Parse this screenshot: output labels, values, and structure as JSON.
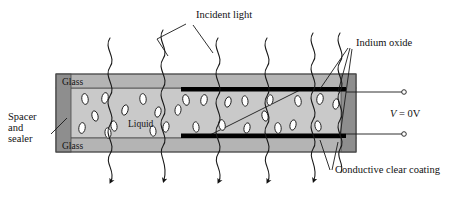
{
  "figure": {
    "type": "liquid-crystal-cell-cross-section",
    "canvas": {
      "width": 473,
      "height": 197
    },
    "background": "#ffffff"
  },
  "colors": {
    "glass_fill": "#b4b4b4",
    "liquid_fill": "#c9c9c9",
    "spacer_fill": "#8e8e8e",
    "electrode_fill": "#000000",
    "outline": "#4a4a4a",
    "ink": "#111111",
    "lc_particle_fill": "#ffffff"
  },
  "labels": {
    "incident_light": "Incident light",
    "indium_oxide": "Indium oxide",
    "conductive_clear_coating": "Conductive clear coating",
    "spacer_line1": "Spacer",
    "spacer_line2": "and",
    "spacer_line3": "sealer",
    "glass_top": "Glass",
    "glass_bottom": "Glass",
    "liquid": "Liquid",
    "voltage_symbol": "V",
    "voltage_value": " = 0V"
  },
  "geometry": {
    "cell": {
      "x": 56,
      "y": 74,
      "width": 300,
      "height": 78
    },
    "glass_top_band": {
      "x": 56,
      "y": 74,
      "width": 300,
      "height": 14
    },
    "glass_bottom_band": {
      "x": 56,
      "y": 138,
      "width": 300,
      "height": 14
    },
    "liquid_region": {
      "x": 56,
      "y": 88,
      "width": 300,
      "height": 50
    },
    "spacer_left": {
      "x": 56,
      "y": 74,
      "width": 15,
      "height": 78
    },
    "spacer_right": {
      "x": 341,
      "y": 74,
      "width": 15,
      "height": 78
    },
    "electrode_top": {
      "x": 181,
      "y": 87,
      "width": 165,
      "height": 4
    },
    "electrode_bottom": {
      "x": 181,
      "y": 134,
      "width": 165,
      "height": 4
    }
  },
  "rays": [
    {
      "id": "ray-1",
      "x": 110,
      "top": 38,
      "bottom": 190,
      "arrow": true
    },
    {
      "id": "ray-2",
      "x": 163,
      "top": 30,
      "bottom": 190,
      "arrow": true
    },
    {
      "id": "ray-3",
      "x": 218,
      "top": 38,
      "bottom": 190,
      "arrow": true
    },
    {
      "id": "ray-4",
      "x": 267,
      "top": 38,
      "bottom": 190,
      "arrow": true
    },
    {
      "id": "ray-5",
      "x": 313,
      "top": 33,
      "bottom": 190,
      "arrow": true
    },
    {
      "id": "ray-6",
      "x": 340,
      "top": 33,
      "bottom": 178,
      "arrow": false
    }
  ],
  "lc_particles": [
    {
      "cx": 85,
      "cy": 99,
      "rx": 3.2,
      "ry": 5.4,
      "rot": -8
    },
    {
      "cx": 105,
      "cy": 98,
      "rx": 3.2,
      "ry": 5.4,
      "rot": 10
    },
    {
      "cx": 143,
      "cy": 99,
      "rx": 3.2,
      "ry": 5.4,
      "rot": -5
    },
    {
      "cx": 125,
      "cy": 110,
      "rx": 3.0,
      "ry": 5.2,
      "rot": 15
    },
    {
      "cx": 95,
      "cy": 116,
      "rx": 3.0,
      "ry": 5.2,
      "rot": -14
    },
    {
      "cx": 82,
      "cy": 128,
      "rx": 3.2,
      "ry": 5.4,
      "rot": 8
    },
    {
      "cx": 114,
      "cy": 126,
      "rx": 3.0,
      "ry": 5.2,
      "rot": -10
    },
    {
      "cx": 158,
      "cy": 112,
      "rx": 3.0,
      "ry": 5.2,
      "rot": 12
    },
    {
      "cx": 153,
      "cy": 131,
      "rx": 3.0,
      "ry": 5.2,
      "rot": -6
    },
    {
      "cx": 178,
      "cy": 110,
      "rx": 3.0,
      "ry": 5.2,
      "rot": 6
    },
    {
      "cx": 186,
      "cy": 100,
      "rx": 3.2,
      "ry": 5.4,
      "rot": -12
    },
    {
      "cx": 204,
      "cy": 100,
      "rx": 3.2,
      "ry": 5.4,
      "rot": 9
    },
    {
      "cx": 196,
      "cy": 127,
      "rx": 3.0,
      "ry": 5.2,
      "rot": -8
    },
    {
      "cx": 228,
      "cy": 102,
      "rx": 3.0,
      "ry": 5.2,
      "rot": 14
    },
    {
      "cx": 222,
      "cy": 125,
      "rx": 3.2,
      "ry": 5.4,
      "rot": -10
    },
    {
      "cx": 245,
      "cy": 101,
      "rx": 3.0,
      "ry": 5.2,
      "rot": -6
    },
    {
      "cx": 247,
      "cy": 128,
      "rx": 3.0,
      "ry": 5.2,
      "rot": 11
    },
    {
      "cx": 265,
      "cy": 116,
      "rx": 3.0,
      "ry": 5.2,
      "rot": -13
    },
    {
      "cx": 270,
      "cy": 100,
      "rx": 3.0,
      "ry": 5.2,
      "rot": 7
    },
    {
      "cx": 278,
      "cy": 128,
      "rx": 3.2,
      "ry": 5.4,
      "rot": -5
    },
    {
      "cx": 293,
      "cy": 125,
      "rx": 3.0,
      "ry": 5.2,
      "rot": 12
    },
    {
      "cx": 298,
      "cy": 101,
      "rx": 3.2,
      "ry": 5.4,
      "rot": -9
    },
    {
      "cx": 320,
      "cy": 99,
      "rx": 3.2,
      "ry": 5.4,
      "rot": 8
    },
    {
      "cx": 318,
      "cy": 126,
      "rx": 3.0,
      "ry": 5.2,
      "rot": -11
    },
    {
      "cx": 336,
      "cy": 104,
      "rx": 3.0,
      "ry": 5.2,
      "rot": 10
    },
    {
      "cx": 108,
      "cy": 133,
      "rx": 3.0,
      "ry": 5.2,
      "rot": -7
    },
    {
      "cx": 166,
      "cy": 127,
      "rx": 3.0,
      "ry": 5.2,
      "rot": 9
    }
  ],
  "terminals": [
    {
      "id": "terminal-top",
      "cx": 404,
      "cy": 93,
      "r": 2.2,
      "wire_from_x": 346,
      "wire_y": 93
    },
    {
      "id": "terminal-bottom",
      "cx": 404,
      "cy": 133,
      "r": 2.2,
      "wire_from_x": 346,
      "wire_y": 133
    }
  ]
}
